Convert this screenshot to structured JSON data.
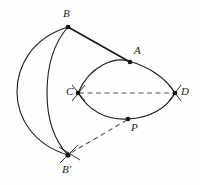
{
  "figure": {
    "width": 200,
    "height": 185,
    "background_color": "#fefefe",
    "stroke_color": "#1a1a1a",
    "dash_color": "#555555",
    "labels": [
      {
        "id": "B",
        "text": "B",
        "x": 63,
        "y": 8,
        "point_x": 68,
        "point_y": 27
      },
      {
        "id": "A",
        "text": "A",
        "x": 134,
        "y": 45,
        "point_x": 130,
        "point_y": 62
      },
      {
        "id": "C",
        "text": "C",
        "x": 66,
        "y": 86,
        "point_x": 78,
        "point_y": 93
      },
      {
        "id": "D",
        "text": "D",
        "x": 181,
        "y": 86,
        "point_x": 175,
        "point_y": 93
      },
      {
        "id": "P",
        "text": "P",
        "x": 131,
        "y": 122,
        "point_x": 128,
        "point_y": 119
      },
      {
        "id": "Bp",
        "text": "B'",
        "x": 62,
        "y": 164,
        "point_x": 68,
        "point_y": 155
      }
    ],
    "elements": {
      "outer_arc_label": "large arc from B to B' bulging left",
      "inner_arc_label": "inner arc from B to B'",
      "lens_upper_label": "upper arc of lens from C to D through A",
      "lens_lower_label": "lower arc of lens from C to D through P",
      "segment_ba_label": "solid segment from B to A",
      "dashed_cd_label": "dashed segment from C to D",
      "dashed_pb_label": "dashed segment from P to B'"
    }
  }
}
